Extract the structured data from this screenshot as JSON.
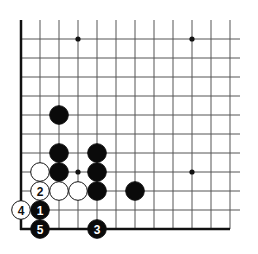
{
  "diagram": {
    "type": "go-board-fragment",
    "corner": "bottom-left",
    "grid": {
      "origin_x": 21,
      "bottom_y": 229,
      "spacing": 19,
      "columns": 12,
      "rows_above_edge": 11,
      "line_top_y": 20,
      "line_right_x": 240
    },
    "star_points": [
      {
        "col": 3,
        "row": 10
      },
      {
        "col": 9,
        "row": 10
      },
      {
        "col": 3,
        "row": 3
      },
      {
        "col": 9,
        "row": 3
      }
    ],
    "stones": [
      {
        "color": "black",
        "col": 2,
        "row": 6,
        "label": ""
      },
      {
        "color": "black",
        "col": 2,
        "row": 4,
        "label": ""
      },
      {
        "color": "black",
        "col": 2,
        "row": 3,
        "label": ""
      },
      {
        "color": "white",
        "col": 1,
        "row": 3,
        "label": ""
      },
      {
        "color": "black",
        "col": 4,
        "row": 4,
        "label": ""
      },
      {
        "color": "black",
        "col": 4,
        "row": 3,
        "label": ""
      },
      {
        "color": "black",
        "col": 4,
        "row": 2,
        "label": ""
      },
      {
        "color": "white",
        "col": 1,
        "row": 2,
        "label": "2"
      },
      {
        "color": "white",
        "col": 2,
        "row": 2,
        "label": ""
      },
      {
        "color": "white",
        "col": 3,
        "row": 2,
        "label": ""
      },
      {
        "color": "black",
        "col": 6,
        "row": 2,
        "label": ""
      },
      {
        "color": "black",
        "col": 1,
        "row": 1,
        "label": "1"
      },
      {
        "color": "white",
        "col": 0,
        "row": 1,
        "label": "4"
      },
      {
        "color": "black",
        "col": 1,
        "row": 0,
        "label": "5"
      },
      {
        "color": "black",
        "col": 4,
        "row": 0,
        "label": "3"
      }
    ]
  }
}
